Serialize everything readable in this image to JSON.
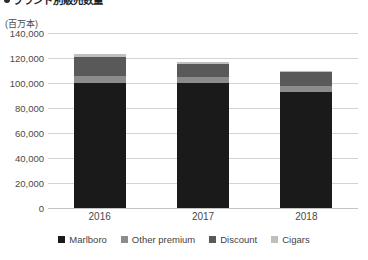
{
  "title": {
    "bullet": "•",
    "text": "ブランド別販売数量"
  },
  "unit_label": "(百万本)",
  "chart_data": {
    "type": "bar",
    "subtype": "stacked-vertical",
    "title": "ブランド別販売数量",
    "xlabel": "",
    "ylabel": "(百万本)",
    "ylim": [
      0,
      140000
    ],
    "ytick_step": 20000,
    "ytick_labels": [
      "0",
      "20,000",
      "40,000",
      "60,000",
      "80,000",
      "100,000",
      "120,000",
      "140,000"
    ],
    "ytick_values": [
      0,
      20000,
      40000,
      60000,
      80000,
      100000,
      120000,
      140000
    ],
    "grid": true,
    "grid_axis": "y",
    "legend_position": "bottom",
    "categories": [
      "2016",
      "2017",
      "2018"
    ],
    "series": [
      {
        "name": "Marlboro",
        "color": "#1a1a1a",
        "values": [
          100000,
          100000,
          93000
        ]
      },
      {
        "name": "Other premium",
        "color": "#8c8c8c",
        "values": [
          6000,
          5000,
          5000
        ]
      },
      {
        "name": "Discount",
        "color": "#595959",
        "values": [
          15000,
          10000,
          10500
        ]
      },
      {
        "name": "Cigars",
        "color": "#bfbfbf",
        "values": [
          2000,
          2000,
          1500
        ]
      }
    ],
    "totals": [
      123000,
      117000,
      110000
    ]
  },
  "legend": {
    "items": [
      {
        "label": "Marlboro",
        "color": "#1a1a1a"
      },
      {
        "label": "Other premium",
        "color": "#8c8c8c"
      },
      {
        "label": "Discount",
        "color": "#595959"
      },
      {
        "label": "Cigars",
        "color": "#bfbfbf"
      }
    ]
  },
  "colors": {
    "gridline": "#d3d3d3",
    "axis": "#c4c4c4",
    "text": "#4a4a4a",
    "background": "#ffffff"
  }
}
